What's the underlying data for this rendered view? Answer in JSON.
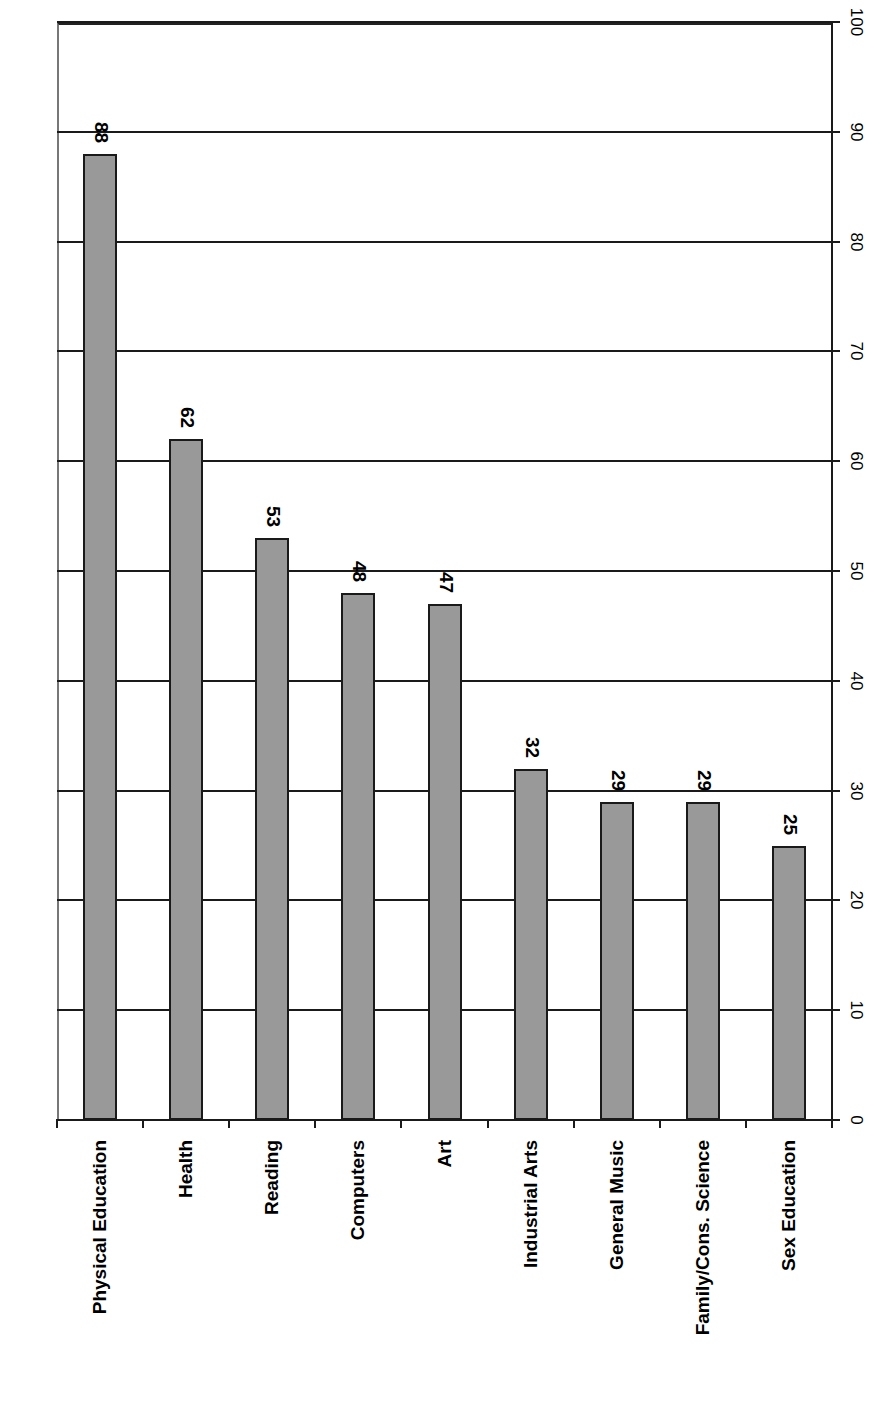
{
  "chart_data": {
    "type": "bar",
    "orientation": "vertical bars rendered rotated 90 degrees (value axis on right, category labels at bottom rotated)",
    "title": "",
    "xlabel": "",
    "ylabel": "",
    "categories": [
      "Physical Education",
      "Health",
      "Reading",
      "Computers",
      "Art",
      "Industrial Arts",
      "General Music",
      "Family/Cons. Science",
      "Sex Education"
    ],
    "values": [
      88,
      62,
      53,
      48,
      47,
      32,
      29,
      29,
      25
    ],
    "data_labels": [
      "88",
      "62",
      "53",
      "48",
      "47",
      "32",
      "29",
      "29",
      "25"
    ],
    "ylim": [
      0,
      100
    ],
    "y_ticks": [
      "0",
      "10",
      "20",
      "30",
      "40",
      "50",
      "60",
      "70",
      "80",
      "90",
      "100"
    ],
    "grid": true,
    "legend": null,
    "bar_color": "#999999",
    "bar_border_color": "#1a1a1a"
  }
}
